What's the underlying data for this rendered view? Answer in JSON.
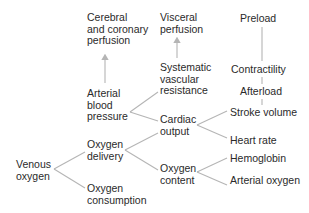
{
  "diagram": {
    "type": "tree",
    "colors": {
      "text": "#2a2a2a",
      "line": "#b5b5b5",
      "background": "#ffffff"
    },
    "nodes": {
      "cerebral": "Cerebral\nand coronary\nperfusion",
      "visceral": "Visceral\nperfusion",
      "preload": "Preload",
      "arterial_bp": "Arterial\nblood\npressure",
      "svr": "Systematic\nvascular\nresistance",
      "contractility": "Contractility",
      "afterload": "Afterload",
      "stroke_volume": "Stroke volume",
      "cardiac_output": "Cardiac\noutput",
      "heart_rate": "Heart rate",
      "oxygen_delivery": "Oxygen\ndelivery",
      "venous_oxygen": "Venous\noxygen",
      "oxygen_content": "Oxygen\ncontent",
      "hemoglobin": "Hemoglobin",
      "arterial_oxygen": "Arterial oxygen",
      "oxygen_consumption": "Oxygen\nconsumption"
    },
    "edges": [
      {
        "from": "venous_oxygen",
        "to": "oxygen_delivery"
      },
      {
        "from": "venous_oxygen",
        "to": "oxygen_consumption"
      },
      {
        "from": "oxygen_delivery",
        "to": "cardiac_output"
      },
      {
        "from": "oxygen_delivery",
        "to": "oxygen_content"
      },
      {
        "from": "arterial_bp",
        "to": "svr"
      },
      {
        "from": "arterial_bp",
        "to": "cardiac_output"
      },
      {
        "from": "cardiac_output",
        "to": "stroke_volume"
      },
      {
        "from": "cardiac_output",
        "to": "heart_rate"
      },
      {
        "from": "oxygen_content",
        "to": "hemoglobin"
      },
      {
        "from": "oxygen_content",
        "to": "arterial_oxygen"
      },
      {
        "from": "stroke_volume",
        "to": "afterload"
      },
      {
        "from": "afterload",
        "to": "contractility"
      },
      {
        "from": "contractility",
        "to": "preload"
      },
      {
        "from": "arterial_bp",
        "to": "cerebral",
        "arrow": true
      },
      {
        "from": "svr",
        "to": "visceral",
        "arrow": true
      }
    ]
  }
}
